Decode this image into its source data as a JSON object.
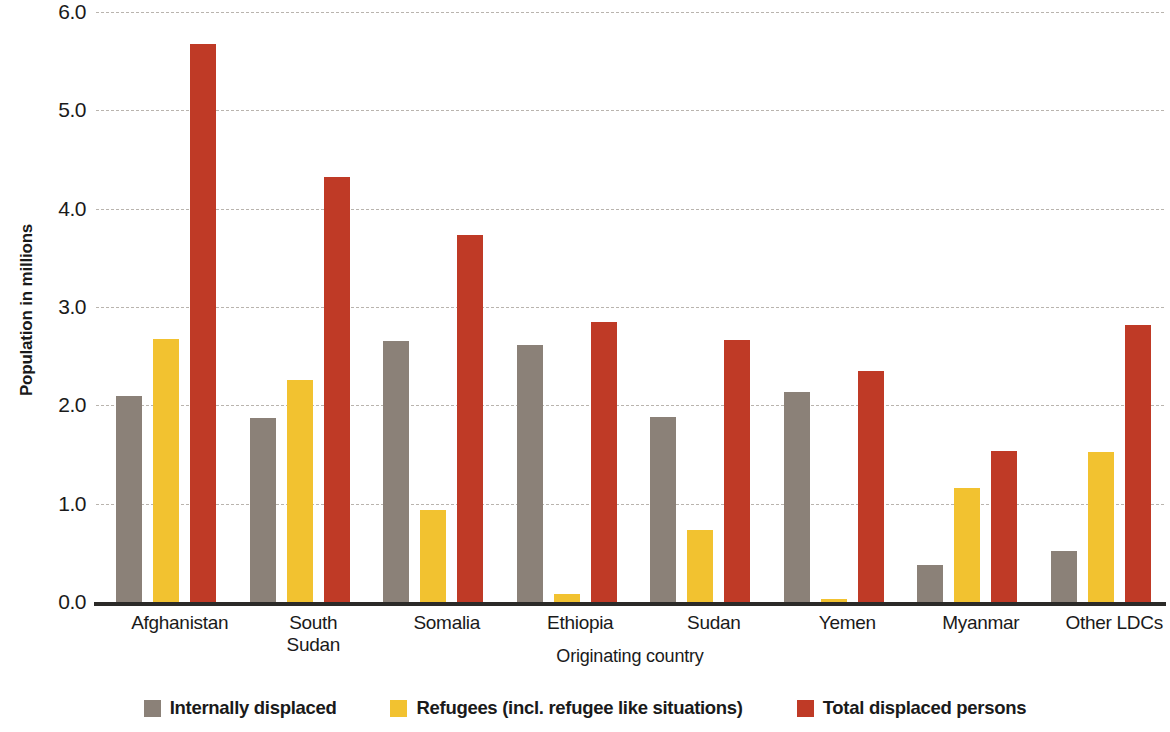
{
  "chart_data": {
    "type": "bar",
    "title": "",
    "xlabel": "Originating country",
    "ylabel": "Population in millions",
    "ylim": [
      0.0,
      6.0
    ],
    "ytick_labels": [
      "6.0",
      "5.0",
      "4.0",
      "3.0",
      "2.0",
      "1.0",
      "0.0"
    ],
    "ytick_values": [
      6.0,
      5.0,
      4.0,
      3.0,
      2.0,
      1.0,
      0.0
    ],
    "grid": true,
    "legend_position": "bottom",
    "categories": [
      "Afghanistan",
      "South Sudan",
      "Somalia",
      "Ethiopia",
      "Sudan",
      "Yemen",
      "Myanmar",
      "Other LDCs"
    ],
    "series": [
      {
        "name": "Internally displaced",
        "color": "#8b8178",
        "values": [
          2.1,
          1.87,
          2.65,
          2.61,
          1.88,
          2.14,
          0.38,
          0.52
        ]
      },
      {
        "name": "Refugees (incl. refugee like situations)",
        "color": "#f2c230",
        "values": [
          2.67,
          2.26,
          0.94,
          0.08,
          0.73,
          0.03,
          1.16,
          1.53
        ]
      },
      {
        "name": "Total displaced persons",
        "color": "#bf3a26",
        "values": [
          5.67,
          4.32,
          3.73,
          2.85,
          2.66,
          2.35,
          1.54,
          2.82
        ]
      }
    ]
  },
  "legend": {
    "items": [
      {
        "label": "Internally displaced",
        "color": "#8b8178"
      },
      {
        "label": "Refugees (incl. refugee like situations)",
        "color": "#f2c230"
      },
      {
        "label": "Total displaced persons",
        "color": "#bf3a26"
      }
    ]
  }
}
